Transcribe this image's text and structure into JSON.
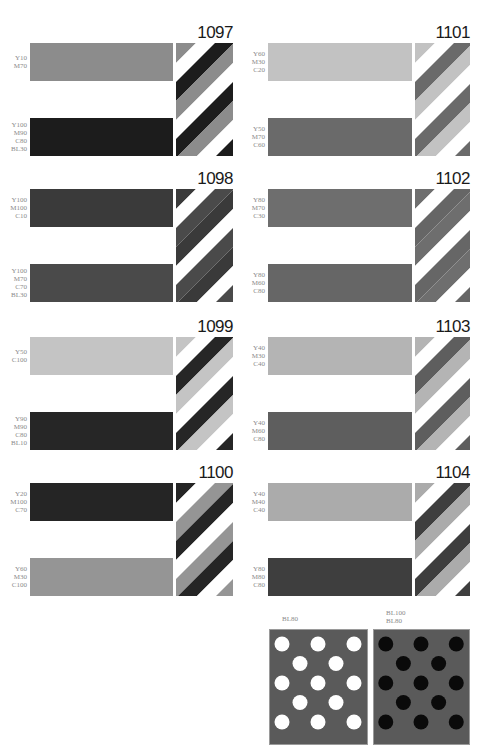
{
  "swatches": [
    {
      "number": "1097",
      "top": {
        "label": [
          "Y10",
          "M70"
        ],
        "color": "#8c8c8c"
      },
      "bottom": {
        "label": [
          "Y100",
          "M90",
          "C80",
          "BL30"
        ],
        "color": "#1c1c1c"
      }
    },
    {
      "number": "1101",
      "top": {
        "label": [
          "Y60",
          "M30",
          "C20"
        ],
        "color": "#c2c2c2"
      },
      "bottom": {
        "label": [
          "Y50",
          "M70",
          "C60"
        ],
        "color": "#6a6a6a"
      }
    },
    {
      "number": "1098",
      "top": {
        "label": [
          "Y100",
          "M100",
          "C10"
        ],
        "color": "#3a3a3a"
      },
      "bottom": {
        "label": [
          "Y100",
          "M70",
          "C70",
          "BL30"
        ],
        "color": "#4a4a4a"
      }
    },
    {
      "number": "1102",
      "top": {
        "label": [
          "Y80",
          "M70",
          "C30"
        ],
        "color": "#6e6e6e"
      },
      "bottom": {
        "label": [
          "Y80",
          "M60",
          "C80"
        ],
        "color": "#666666"
      }
    },
    {
      "number": "1099",
      "top": {
        "label": [
          "Y50",
          "C100"
        ],
        "color": "#c4c4c4"
      },
      "bottom": {
        "label": [
          "Y90",
          "M90",
          "C80",
          "BL10"
        ],
        "color": "#262626"
      }
    },
    {
      "number": "1103",
      "top": {
        "label": [
          "Y40",
          "M30",
          "C40"
        ],
        "color": "#b4b4b4"
      },
      "bottom": {
        "label": [
          "Y40",
          "M60",
          "C80"
        ],
        "color": "#5e5e5e"
      }
    },
    {
      "number": "1100",
      "top": {
        "label": [
          "Y20",
          "M100",
          "C70"
        ],
        "color": "#252525"
      },
      "bottom": {
        "label": [
          "Y60",
          "M30",
          "C100"
        ],
        "color": "#959595"
      }
    },
    {
      "number": "1104",
      "top": {
        "label": [
          "Y40",
          "M40",
          "C40"
        ],
        "color": "#ababab"
      },
      "bottom": {
        "label": [
          "Y80",
          "M80",
          "C80"
        ],
        "color": "#3e3e3e"
      }
    }
  ],
  "dot_panels": [
    {
      "label": [
        "BL80"
      ],
      "background": "#5a5a5a",
      "dot_color": "#ffffff"
    },
    {
      "label": [
        "BL100",
        "BL80"
      ],
      "background": "#5a5a5a",
      "dot_color": "#0a0a0a"
    }
  ]
}
